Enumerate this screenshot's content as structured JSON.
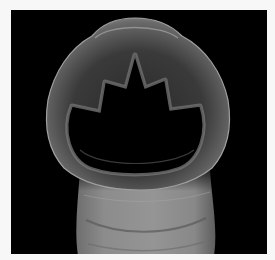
{
  "image": {
    "subject": "Scanning electron micrograph of a hookworm head showing oral cavity with cutting teeth",
    "background_color": "#000000",
    "border_color": "#f7f7f7",
    "specimen_tone": "#8a8a8a",
    "caption": ""
  }
}
